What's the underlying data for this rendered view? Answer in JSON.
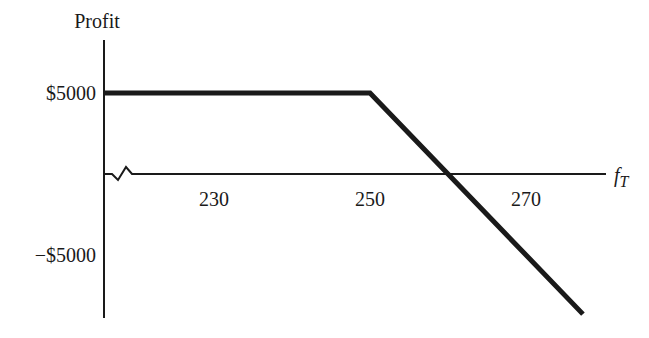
{
  "chart_data": {
    "type": "line",
    "title": "",
    "ylabel": "Profit",
    "xlabel": "f",
    "xlabel_subscript": "T",
    "x_ticks": [
      {
        "value": 230,
        "label": "230"
      },
      {
        "value": 250,
        "label": "250"
      },
      {
        "value": 270,
        "label": "270"
      }
    ],
    "y_ticks": [
      {
        "value": 5000,
        "label": "$5000"
      },
      {
        "value": -5000,
        "label": "−$5000"
      }
    ],
    "xlim": [
      216,
      282
    ],
    "ylim": [
      -9000,
      8500
    ],
    "axis_break": true,
    "grid": false,
    "legend": "none",
    "series": [
      {
        "name": "Profit",
        "x": [
          216,
          250,
          260,
          277.3
        ],
        "y": [
          5000,
          5000,
          0,
          -8650
        ]
      }
    ],
    "colors": {
      "line": "#1a1a1a",
      "axis": "#1a1a1a"
    }
  }
}
